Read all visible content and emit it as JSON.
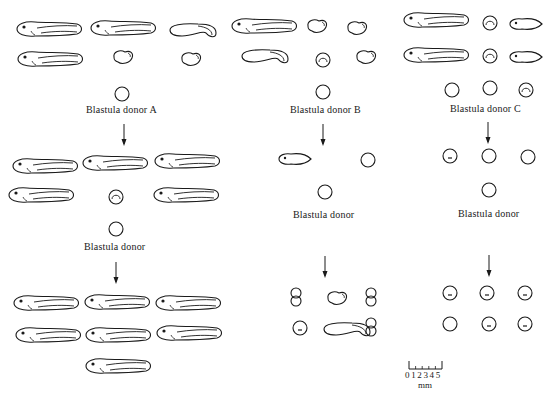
{
  "figure": {
    "columns": [
      {
        "id": "A",
        "donor_label": "Blastula donor A",
        "second_donor_label": "Blastula donor",
        "generation_1": {
          "tadpoles": 4,
          "abnormal": 2,
          "rows": 2
        },
        "generation_2": {
          "tadpoles": 5,
          "blastula_like": 1
        },
        "generation_3": {
          "tadpoles": 7
        }
      },
      {
        "id": "B",
        "donor_label": "Blastula donor B",
        "second_donor_label": "Blastula donor",
        "generation_1": {
          "tadpoles": 2,
          "abnormal": 3,
          "blastula_like": 1
        },
        "generation_2": {
          "tadpoles": 1,
          "blastula_like": 1
        },
        "generation_3": {
          "abnormal": 6
        }
      },
      {
        "id": "C",
        "donor_label": "Blastula donor C",
        "second_donor_label": "Blastula donor",
        "generation_1": {
          "tadpoles": 2,
          "abnormal": 2,
          "blastula_like": 5
        },
        "generation_2": {
          "blastula_like": 3
        },
        "generation_3": {
          "blastula_like": 6
        }
      }
    ],
    "scale_bar": {
      "ticks": "0 1 2 3 4 5",
      "unit": "mm"
    },
    "colors": {
      "line": "#1a1a1a",
      "background": "#ffffff"
    }
  }
}
